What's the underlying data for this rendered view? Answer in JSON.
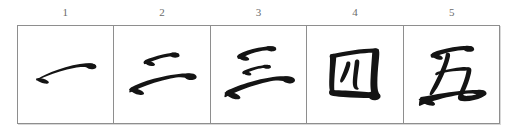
{
  "sheet": {
    "title": "Chinese numerals brush-stroke practice grid",
    "background_color": "#ffffff",
    "ink_color": "#141414",
    "rule_color": "#8e8e8e",
    "label_color": "#6b6b6b",
    "cell_count": 5
  },
  "column_labels": [
    {
      "text": "1"
    },
    {
      "text": "2"
    },
    {
      "text": "3"
    },
    {
      "text": "4"
    },
    {
      "text": "5"
    }
  ],
  "cells": [
    {
      "index": "1",
      "character": "一",
      "reading": "yi",
      "meaning": "one",
      "stroke_count": "1"
    },
    {
      "index": "2",
      "character": "二",
      "reading": "er",
      "meaning": "two",
      "stroke_count": "2"
    },
    {
      "index": "3",
      "character": "三",
      "reading": "san",
      "meaning": "three",
      "stroke_count": "3"
    },
    {
      "index": "4",
      "character": "四",
      "reading": "si",
      "meaning": "four",
      "stroke_count": "5"
    },
    {
      "index": "5",
      "character": "五",
      "reading": "wu",
      "meaning": "five",
      "stroke_count": "4"
    }
  ]
}
